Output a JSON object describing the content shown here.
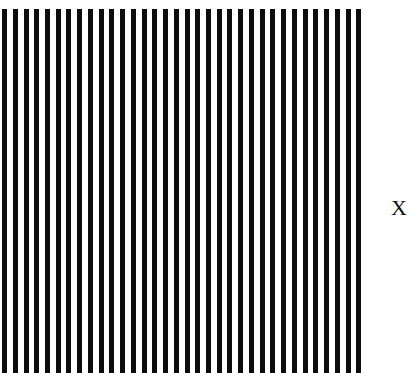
{
  "figure": {
    "type": "square-wave-grating-stimulus",
    "background_color": "#ffffff",
    "width": 412,
    "height": 373
  },
  "grating": {
    "name": "vertical-square-wave-grating",
    "bar_color": "#0d0d0d",
    "gap_color": "#ffffff",
    "orientation": "vertical",
    "bar_count": 34,
    "first_bar_left": 2,
    "period_px": 10.73,
    "bar_width_px": 5,
    "field_top": 9,
    "field_bottom": 373,
    "field_left": 2,
    "field_right": 367
  },
  "label": {
    "name": "x-label",
    "text": "X",
    "color": "#111111",
    "font_size_px": 22,
    "left": 391,
    "top": 197
  },
  "chart_data": {
    "type": "bar",
    "title": "",
    "subtitle": "",
    "xlabel": "",
    "ylabel": "",
    "legend": [],
    "annotations": [
      {
        "text": "X",
        "x": 398,
        "y": 208,
        "role": "fixation-or-reference-marker"
      }
    ],
    "grid": false,
    "axis_visible": false,
    "tick_labels": [],
    "categories": [
      "bar-1",
      "bar-2",
      "bar-3",
      "bar-4",
      "bar-5",
      "bar-6",
      "bar-7",
      "bar-8",
      "bar-9",
      "bar-10",
      "bar-11",
      "bar-12",
      "bar-13",
      "bar-14",
      "bar-15",
      "bar-16",
      "bar-17",
      "bar-18",
      "bar-19",
      "bar-20",
      "bar-21",
      "bar-22",
      "bar-23",
      "bar-24",
      "bar-25",
      "bar-26",
      "bar-27",
      "bar-28",
      "bar-29",
      "bar-30",
      "bar-31",
      "bar-32",
      "bar-33",
      "bar-34"
    ],
    "values": [
      364,
      364,
      364,
      364,
      364,
      364,
      364,
      364,
      364,
      364,
      364,
      364,
      364,
      364,
      364,
      364,
      364,
      364,
      364,
      364,
      364,
      364,
      364,
      364,
      364,
      364,
      364,
      364,
      364,
      364,
      364,
      364,
      364,
      364
    ],
    "x_positions": [
      2.0,
      12.7,
      23.5,
      34.2,
      44.9,
      55.7,
      66.4,
      77.1,
      87.9,
      98.6,
      109.3,
      120.1,
      130.8,
      141.5,
      152.3,
      163.0,
      173.7,
      184.5,
      195.2,
      205.9,
      216.7,
      227.4,
      238.1,
      248.9,
      259.6,
      270.3,
      281.1,
      291.8,
      302.5,
      313.3,
      324.0,
      334.7,
      345.5,
      356.2
    ],
    "ylim": [
      0,
      373
    ],
    "xlim": [
      0,
      412
    ]
  }
}
